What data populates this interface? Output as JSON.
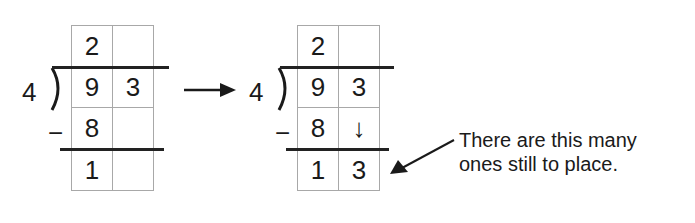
{
  "diagram": {
    "before": {
      "divisor": "4",
      "cells": [
        [
          "2",
          ""
        ],
        [
          "9",
          "3"
        ],
        [
          "8",
          ""
        ],
        [
          "1",
          ""
        ]
      ],
      "minus_sign": "−"
    },
    "transition_arrow": "→",
    "after": {
      "divisor": "4",
      "cells": [
        [
          "2",
          ""
        ],
        [
          "9",
          "3"
        ],
        [
          "8",
          "↓"
        ],
        [
          "1",
          "3"
        ]
      ],
      "minus_sign": "−"
    },
    "annotation": {
      "line1": "There are this many",
      "line2": "ones still to place."
    },
    "colors": {
      "grid_line": "#a8a8a8",
      "ink": "#1a1a1a"
    }
  }
}
